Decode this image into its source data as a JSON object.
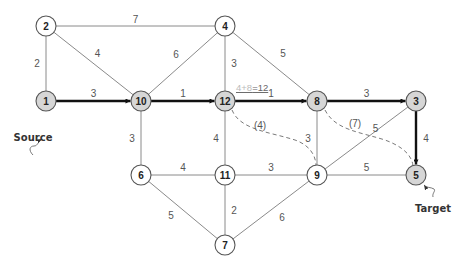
{
  "diagram": {
    "type": "weighted-graph-shortest-path",
    "colors": {
      "path_node_fill": "#d6d6d6",
      "normal_node_fill": "#ffffff",
      "path_edge": "#111111",
      "normal_edge": "#8a8a8a",
      "dashed_edge": "#7a7a7a"
    },
    "nodes": [
      {
        "id": "1",
        "x": 18,
        "y": 127,
        "on_path": true
      },
      {
        "id": "2",
        "x": 18,
        "y": 25,
        "on_path": false
      },
      {
        "id": "3",
        "x": 416,
        "y": 101,
        "on_path": true
      },
      {
        "id": "4",
        "x": 225,
        "y": 25,
        "on_path": false
      },
      {
        "id": "5",
        "x": 416,
        "y": 175,
        "on_path": true
      },
      {
        "id": "6",
        "x": 141,
        "y": 175,
        "on_path": false
      },
      {
        "id": "7",
        "x": 225,
        "y": 245,
        "on_path": false
      },
      {
        "id": "8",
        "x": 317,
        "y": 101,
        "on_path": true
      },
      {
        "id": "9",
        "x": 317,
        "y": 175,
        "on_path": false
      },
      {
        "id": "10",
        "x": 141,
        "y": 101,
        "on_path": true
      },
      {
        "id": "11",
        "x": 225,
        "y": 175,
        "on_path": false
      },
      {
        "id": "12",
        "x": 225,
        "y": 101,
        "on_path": true
      }
    ],
    "edges": [
      {
        "from": "1",
        "to": "2",
        "weight": "2",
        "style": "normal"
      },
      {
        "from": "2",
        "to": "4",
        "weight": "7",
        "style": "normal"
      },
      {
        "from": "2",
        "to": "10",
        "weight": "4",
        "style": "normal"
      },
      {
        "from": "1",
        "to": "10",
        "weight": "3",
        "style": "path"
      },
      {
        "from": "10",
        "to": "4",
        "weight": "6",
        "style": "normal"
      },
      {
        "from": "10",
        "to": "12",
        "weight": "1",
        "style": "path"
      },
      {
        "from": "10",
        "to": "6",
        "weight": "3",
        "style": "normal"
      },
      {
        "from": "4",
        "to": "12",
        "weight": "3",
        "style": "normal"
      },
      {
        "from": "4",
        "to": "8",
        "weight": "5",
        "style": "normal"
      },
      {
        "from": "12",
        "to": "8",
        "weight": "1",
        "style": "path"
      },
      {
        "from": "12",
        "to": "11",
        "weight": "4",
        "style": "normal"
      },
      {
        "from": "8",
        "to": "3",
        "weight": "3",
        "style": "path"
      },
      {
        "from": "8",
        "to": "9",
        "weight": "3",
        "style": "normal"
      },
      {
        "from": "3",
        "to": "5",
        "weight": "4",
        "style": "path"
      },
      {
        "from": "3",
        "to": "9",
        "weight": "5",
        "style": "normal"
      },
      {
        "from": "6",
        "to": "11",
        "weight": "4",
        "style": "normal"
      },
      {
        "from": "6",
        "to": "7",
        "weight": "5",
        "style": "normal"
      },
      {
        "from": "11",
        "to": "9",
        "weight": "3",
        "style": "normal"
      },
      {
        "from": "11",
        "to": "7",
        "weight": "2",
        "style": "normal"
      },
      {
        "from": "9",
        "to": "5",
        "weight": "5",
        "style": "normal"
      },
      {
        "from": "9",
        "to": "7",
        "weight": "6",
        "style": "normal"
      }
    ],
    "dashed_edges": [
      {
        "from": "12",
        "to": "9",
        "label": "(4)"
      },
      {
        "from": "8",
        "to": "5",
        "label": "(7)"
      }
    ],
    "annotation": {
      "faint_part": "4+8",
      "strong_part": "=12"
    },
    "labels": {
      "source": "Source",
      "target": "Target"
    }
  }
}
